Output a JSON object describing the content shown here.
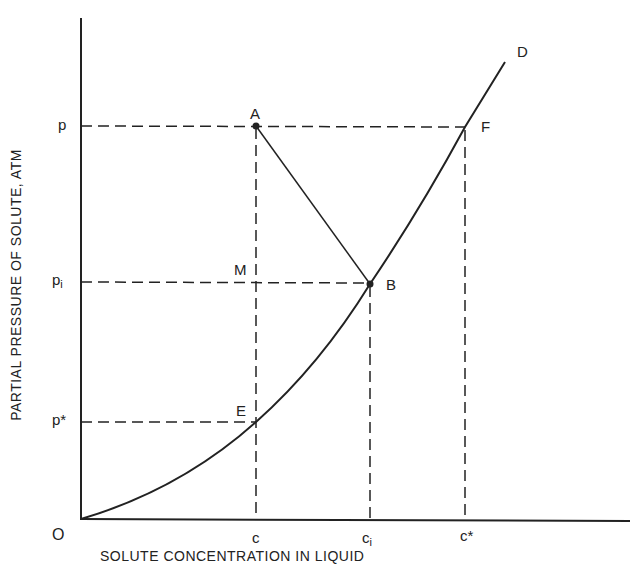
{
  "diagram": {
    "y_axis_label": "PARTIAL PRESSURE OF SOLUTE, ATM",
    "x_axis_label": "SOLUTE CONCENTRATION IN LIQUID",
    "origin_label": "O",
    "y_ticks": {
      "p": "p",
      "pi_base": "p",
      "pi_sub": "i",
      "pstar": "p*"
    },
    "x_ticks": {
      "c": "c",
      "ci_base": "c",
      "ci_sub": "i",
      "cstar": "c*"
    },
    "points": {
      "A": "A",
      "B": "B",
      "D": "D",
      "E": "E",
      "F": "F",
      "M": "M"
    },
    "curve": "equilibrium curve O-E-B-F-D",
    "colors": {
      "ink": "#222222",
      "background": "#ffffff"
    }
  }
}
